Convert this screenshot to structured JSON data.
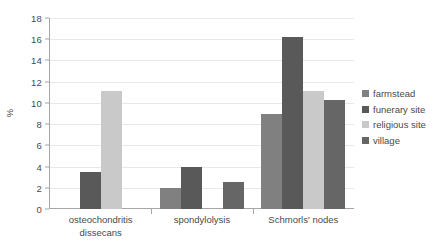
{
  "chart_data": {
    "type": "bar",
    "title": "",
    "subtitle": "",
    "xlabel": "",
    "ylabel": "%",
    "ylim": [
      0,
      18
    ],
    "ytick_step": 2,
    "yticks": [
      "0",
      "2",
      "4",
      "6",
      "8",
      "10",
      "12",
      "14",
      "16",
      "18"
    ],
    "grid": true,
    "legend_position": "right",
    "categories": [
      "osteochondritis dissecans",
      "spondylolysis",
      "Schmorls' nodes"
    ],
    "category_lines": [
      [
        "osteochondritis",
        "dissecans"
      ],
      [
        "spondylolysis"
      ],
      [
        "Schmorls' nodes"
      ]
    ],
    "series": [
      {
        "name": "farmstead",
        "color": "#808080",
        "values": [
          null,
          2.0,
          9.0
        ]
      },
      {
        "name": "funerary site",
        "color": "#595959",
        "values": [
          3.5,
          4.0,
          16.2
        ]
      },
      {
        "name": "religious site",
        "color": "#c9c9c9",
        "values": [
          11.1,
          null,
          11.1
        ]
      },
      {
        "name": "village",
        "color": "#666666",
        "values": [
          null,
          2.5,
          10.3
        ]
      }
    ]
  },
  "colors": {
    "axis": "#a6a6a6",
    "grid": "#e8e8e8",
    "text": "#4a4a4a",
    "background": "#ffffff"
  }
}
